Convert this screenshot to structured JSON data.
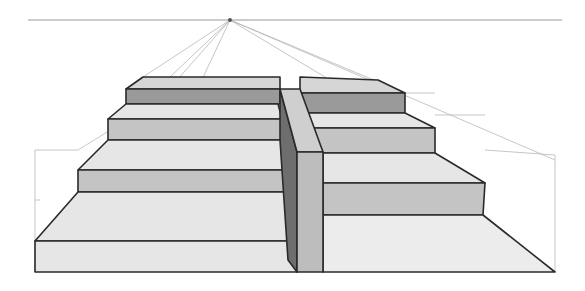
{
  "figure": {
    "width": 585,
    "height": 291
  },
  "colors": {
    "background": "#ffffff",
    "outline": "#2a2a2a",
    "guide_lines": "#b8b8b8",
    "tread_light": "#e6e6e6",
    "tread_mid": "#d6d6d6",
    "riser_mid": "#c4c4c4",
    "riser_dark": "#9a9a9a",
    "wall_top": "#cfcfcf",
    "wall_front": "#bdbdbd",
    "wall_side_shadow": "#6e6e6e",
    "floor": "#ececec"
  },
  "perspective": {
    "horizon_line": {
      "x1": 28,
      "x2": 562,
      "y": 20
    },
    "vanishing_point": {
      "x": 230,
      "y": 20
    }
  },
  "steps_left": [
    {
      "tread": [
        [
          143,
          77
        ],
        [
          280,
          77
        ],
        [
          280,
          89
        ],
        [
          126,
          89
        ]
      ],
      "riser": [
        [
          126,
          89
        ],
        [
          280,
          89
        ],
        [
          280,
          104
        ],
        [
          126,
          104
        ]
      ],
      "riser_color": "riser_dark"
    },
    {
      "tread": [
        [
          126,
          104
        ],
        [
          278,
          104
        ],
        [
          282,
          119
        ],
        [
          108,
          119
        ]
      ],
      "riser": [
        [
          108,
          119
        ],
        [
          282,
          119
        ],
        [
          282,
          140
        ],
        [
          108,
          140
        ]
      ],
      "riser_color": "riser_mid"
    },
    {
      "tread": [
        [
          108,
          140
        ],
        [
          282,
          140
        ],
        [
          286,
          170
        ],
        [
          78,
          170
        ]
      ],
      "riser": [
        [
          78,
          170
        ],
        [
          286,
          170
        ],
        [
          288,
          192
        ],
        [
          78,
          192
        ]
      ],
      "riser_color": "riser_mid"
    },
    {
      "tread": [
        [
          78,
          192
        ],
        [
          288,
          192
        ],
        [
          297,
          241
        ],
        [
          35,
          241
        ]
      ],
      "riser": [
        [
          35,
          241
        ],
        [
          297,
          241
        ],
        [
          297,
          272
        ],
        [
          35,
          272
        ]
      ],
      "riser_color": "tread_light"
    }
  ],
  "steps_right": [
    {
      "tread": [
        [
          300,
          77
        ],
        [
          378,
          80
        ],
        [
          405,
          93
        ],
        [
          300,
          93
        ]
      ],
      "riser": [
        [
          283,
          93
        ],
        [
          405,
          93
        ],
        [
          405,
          113
        ],
        [
          292,
          113
        ]
      ],
      "riser_color": "riser_dark"
    },
    {
      "tread": [
        [
          292,
          113
        ],
        [
          405,
          113
        ],
        [
          435,
          128
        ],
        [
          300,
          128
        ]
      ],
      "riser": [
        [
          300,
          128
        ],
        [
          435,
          128
        ],
        [
          435,
          153
        ],
        [
          310,
          153
        ]
      ],
      "riser_color": "riser_mid"
    },
    {
      "tread": [
        [
          323,
          153
        ],
        [
          435,
          153
        ],
        [
          485,
          183
        ],
        [
          323,
          183
        ]
      ],
      "riser": [
        [
          323,
          183
        ],
        [
          485,
          183
        ],
        [
          483,
          215
        ],
        [
          323,
          215
        ]
      ],
      "riser_color": "riser_mid"
    },
    {
      "floor": [
        [
          323,
          215
        ],
        [
          483,
          215
        ],
        [
          555,
          272
        ],
        [
          323,
          272
        ]
      ]
    }
  ],
  "central_wall": {
    "top": [
      [
        280,
        89
      ],
      [
        300,
        89
      ],
      [
        323,
        152
      ],
      [
        297,
        152
      ]
    ],
    "side_shadow": [
      [
        280,
        89
      ],
      [
        297,
        152
      ],
      [
        297,
        272
      ],
      [
        288,
        260
      ],
      [
        284,
        200
      ],
      [
        280,
        140
      ]
    ],
    "front": [
      [
        297,
        152
      ],
      [
        323,
        152
      ],
      [
        323,
        272
      ],
      [
        297,
        272
      ]
    ]
  },
  "guides": [
    [
      230,
      20,
      143,
      77
    ],
    [
      230,
      20,
      35,
      241
    ],
    [
      230,
      20,
      126,
      241
    ],
    [
      230,
      20,
      405,
      93
    ],
    [
      230,
      20,
      555,
      160
    ],
    [
      230,
      20,
      330,
      80
    ],
    [
      230,
      20,
      170,
      77
    ],
    [
      35,
      150,
      35,
      272
    ],
    [
      35,
      150,
      78,
      150
    ],
    [
      78,
      150,
      143,
      110
    ],
    [
      143,
      77,
      143,
      130
    ],
    [
      555,
      155,
      555,
      272
    ],
    [
      485,
      150,
      555,
      155
    ],
    [
      435,
      115,
      485,
      115
    ],
    [
      405,
      93,
      435,
      93
    ],
    [
      35,
      170,
      35,
      170
    ],
    [
      35,
      200,
      40,
      200
    ]
  ],
  "annotations": []
}
